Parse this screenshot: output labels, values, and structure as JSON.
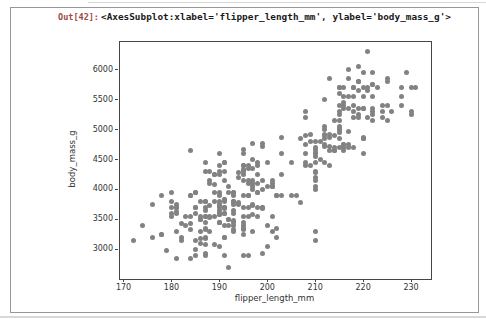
{
  "output_cell": {
    "prompt": "Out[42]:",
    "repr_text": "<AxesSubplot:xlabel='flipper_length_mm', ylabel='body_mass_g'>"
  },
  "colors": {
    "prompt": "#9e4b45",
    "point": "#828282",
    "spine": "#454545",
    "cell_border": "#979797",
    "tick_text": "#333333"
  },
  "chart_data": {
    "type": "scatter",
    "title": "",
    "xlabel": "flipper_length_mm",
    "ylabel": "body_mass_g",
    "xlim": [
      169.05,
      233.95
    ],
    "ylim": [
      2520,
      6480
    ],
    "xticks": [
      170,
      180,
      190,
      200,
      210,
      220,
      230
    ],
    "yticks": [
      3000,
      3500,
      4000,
      4500,
      5000,
      5500,
      6000
    ],
    "grid": false,
    "legend_position": "none",
    "points": [
      [
        181,
        3750
      ],
      [
        186,
        3800
      ],
      [
        195,
        3250
      ],
      [
        193,
        3450
      ],
      [
        190,
        3650
      ],
      [
        181,
        3625
      ],
      [
        195,
        4675
      ],
      [
        193,
        3475
      ],
      [
        190,
        4250
      ],
      [
        186,
        3300
      ],
      [
        180,
        3700
      ],
      [
        182,
        3200
      ],
      [
        191,
        3800
      ],
      [
        198,
        4400
      ],
      [
        185,
        3700
      ],
      [
        195,
        3450
      ],
      [
        197,
        4500
      ],
      [
        184,
        3325
      ],
      [
        194,
        4200
      ],
      [
        174,
        3400
      ],
      [
        180,
        3600
      ],
      [
        189,
        3800
      ],
      [
        185,
        3950
      ],
      [
        180,
        3800
      ],
      [
        187,
        3800
      ],
      [
        183,
        3550
      ],
      [
        187,
        3200
      ],
      [
        172,
        3150
      ],
      [
        180,
        3950
      ],
      [
        178,
        3250
      ],
      [
        178,
        3900
      ],
      [
        188,
        3300
      ],
      [
        184,
        3900
      ],
      [
        195,
        3325
      ],
      [
        196,
        4150
      ],
      [
        190,
        3950
      ],
      [
        180,
        3550
      ],
      [
        181,
        3300
      ],
      [
        184,
        4650
      ],
      [
        182,
        3150
      ],
      [
        195,
        3900
      ],
      [
        186,
        3100
      ],
      [
        196,
        4400
      ],
      [
        185,
        3000
      ],
      [
        190,
        4600
      ],
      [
        182,
        3425
      ],
      [
        179,
        2975
      ],
      [
        190,
        3450
      ],
      [
        191,
        4150
      ],
      [
        186,
        3500
      ],
      [
        188,
        4300
      ],
      [
        190,
        3450
      ],
      [
        200,
        4050
      ],
      [
        187,
        2900
      ],
      [
        191,
        3700
      ],
      [
        186,
        3550
      ],
      [
        193,
        3800
      ],
      [
        181,
        2850
      ],
      [
        194,
        3750
      ],
      [
        185,
        3150
      ],
      [
        195,
        4400
      ],
      [
        185,
        3600
      ],
      [
        192,
        4050
      ],
      [
        184,
        2850
      ],
      [
        192,
        3950
      ],
      [
        195,
        3350
      ],
      [
        188,
        4100
      ],
      [
        190,
        3050
      ],
      [
        198,
        4450
      ],
      [
        190,
        3600
      ],
      [
        190,
        3900
      ],
      [
        196,
        3550
      ],
      [
        197,
        4150
      ],
      [
        190,
        3700
      ],
      [
        195,
        4250
      ],
      [
        191,
        3700
      ],
      [
        184,
        3900
      ],
      [
        187,
        3550
      ],
      [
        195,
        4325
      ],
      [
        189,
        3950
      ],
      [
        187,
        3650
      ],
      [
        191,
        3675
      ],
      [
        183,
        3400
      ],
      [
        193,
        3600
      ],
      [
        184,
        3425
      ],
      [
        199,
        4150
      ],
      [
        190,
        3750
      ],
      [
        181,
        3700
      ],
      [
        197,
        4000
      ],
      [
        198,
        4100
      ],
      [
        191,
        3200
      ],
      [
        193,
        3900
      ],
      [
        197,
        3575
      ],
      [
        191,
        4450
      ],
      [
        196,
        3900
      ],
      [
        188,
        4150
      ],
      [
        199,
        3700
      ],
      [
        189,
        4250
      ],
      [
        189,
        3550
      ],
      [
        187,
        3325
      ],
      [
        198,
        3950
      ],
      [
        176,
        3200
      ],
      [
        202,
        3900
      ],
      [
        186,
        3500
      ],
      [
        199,
        3675
      ],
      [
        191,
        4450
      ],
      [
        195,
        3400
      ],
      [
        191,
        4300
      ],
      [
        210,
        4050
      ],
      [
        190,
        3575
      ],
      [
        197,
        4050
      ],
      [
        193,
        3300
      ],
      [
        199,
        3700
      ],
      [
        187,
        3450
      ],
      [
        190,
        4400
      ],
      [
        191,
        3600
      ],
      [
        200,
        3400
      ],
      [
        185,
        2900
      ],
      [
        193,
        3800
      ],
      [
        193,
        3950
      ],
      [
        187,
        3350
      ],
      [
        188,
        3550
      ],
      [
        190,
        3800
      ],
      [
        192,
        3500
      ],
      [
        185,
        3950
      ],
      [
        190,
        3600
      ],
      [
        184,
        3550
      ],
      [
        195,
        4300
      ],
      [
        193,
        3400
      ],
      [
        187,
        4450
      ],
      [
        201,
        3300
      ],
      [
        190,
        4300
      ],
      [
        191,
        3700
      ],
      [
        197,
        4350
      ],
      [
        191,
        2900
      ],
      [
        196,
        4100
      ],
      [
        188,
        3725
      ],
      [
        199,
        4725
      ],
      [
        189,
        3075
      ],
      [
        189,
        4250
      ],
      [
        187,
        2925
      ],
      [
        198,
        3550
      ],
      [
        176,
        3750
      ],
      [
        202,
        3900
      ],
      [
        186,
        3175
      ],
      [
        199,
        4775
      ],
      [
        191,
        3825
      ],
      [
        195,
        4600
      ],
      [
        191,
        3200
      ],
      [
        210,
        4275
      ],
      [
        192,
        3500
      ],
      [
        196,
        3900
      ],
      [
        193,
        3650
      ],
      [
        188,
        3525
      ],
      [
        197,
        3725
      ],
      [
        198,
        3950
      ],
      [
        178,
        3250
      ],
      [
        197,
        3750
      ],
      [
        195,
        4150
      ],
      [
        198,
        3700
      ],
      [
        193,
        3800
      ],
      [
        194,
        3775
      ],
      [
        185,
        3700
      ],
      [
        201,
        4050
      ],
      [
        190,
        3575
      ],
      [
        201,
        4050
      ],
      [
        197,
        3300
      ],
      [
        181,
        3700
      ],
      [
        190,
        3450
      ],
      [
        195,
        4400
      ],
      [
        181,
        3600
      ],
      [
        191,
        3400
      ],
      [
        187,
        3800
      ],
      [
        193,
        3950
      ],
      [
        195,
        3350
      ],
      [
        197,
        4100
      ],
      [
        200,
        3050
      ],
      [
        200,
        4450
      ],
      [
        191,
        3600
      ],
      [
        205,
        3900
      ],
      [
        187,
        3550
      ],
      [
        201,
        4150
      ],
      [
        187,
        3700
      ],
      [
        203,
        4250
      ],
      [
        195,
        3700
      ],
      [
        199,
        4000
      ],
      [
        195,
        3550
      ],
      [
        210,
        4300
      ],
      [
        192,
        3400
      ],
      [
        205,
        4450
      ],
      [
        210,
        3300
      ],
      [
        187,
        4300
      ],
      [
        196,
        3700
      ],
      [
        196,
        4350
      ],
      [
        196,
        2900
      ],
      [
        201,
        4100
      ],
      [
        190,
        3725
      ],
      [
        212,
        4725
      ],
      [
        187,
        3075
      ],
      [
        198,
        4250
      ],
      [
        199,
        2925
      ],
      [
        201,
        3550
      ],
      [
        193,
        3750
      ],
      [
        203,
        3900
      ],
      [
        187,
        3175
      ],
      [
        197,
        4775
      ],
      [
        191,
        3825
      ],
      [
        203,
        4600
      ],
      [
        202,
        3200
      ],
      [
        194,
        4275
      ],
      [
        206,
        3900
      ],
      [
        189,
        4075
      ],
      [
        195,
        2900
      ],
      [
        207,
        3775
      ],
      [
        202,
        3350
      ],
      [
        193,
        3325
      ],
      [
        210,
        3150
      ],
      [
        192,
        2700
      ],
      [
        211,
        4500
      ],
      [
        230,
        5700
      ],
      [
        210,
        4450
      ],
      [
        218,
        5700
      ],
      [
        215,
        5400
      ],
      [
        210,
        4550
      ],
      [
        211,
        4800
      ],
      [
        219,
        5200
      ],
      [
        209,
        4400
      ],
      [
        215,
        5150
      ],
      [
        214,
        4650
      ],
      [
        216,
        5550
      ],
      [
        214,
        4650
      ],
      [
        213,
        5850
      ],
      [
        210,
        4200
      ],
      [
        217,
        5850
      ],
      [
        210,
        4150
      ],
      [
        221,
        6300
      ],
      [
        209,
        4800
      ],
      [
        222,
        5350
      ],
      [
        218,
        5700
      ],
      [
        215,
        5000
      ],
      [
        213,
        4400
      ],
      [
        215,
        5050
      ],
      [
        215,
        5300
      ],
      [
        215,
        4950
      ],
      [
        216,
        5350
      ],
      [
        215,
        5700
      ],
      [
        210,
        4000
      ],
      [
        220,
        4600
      ],
      [
        222,
        5300
      ],
      [
        209,
        4925
      ],
      [
        207,
        4850
      ],
      [
        230,
        5300
      ],
      [
        220,
        4875
      ],
      [
        220,
        5350
      ],
      [
        213,
        4725
      ],
      [
        219,
        5350
      ],
      [
        208,
        4750
      ],
      [
        208,
        5200
      ],
      [
        208,
        4400
      ],
      [
        225,
        5150
      ],
      [
        210,
        4675
      ],
      [
        216,
        4650
      ],
      [
        222,
        5250
      ],
      [
        217,
        4750
      ],
      [
        210,
        4625
      ],
      [
        225,
        5850
      ],
      [
        213,
        4875
      ],
      [
        215,
        5000
      ],
      [
        210,
        4800
      ],
      [
        220,
        5700
      ],
      [
        210,
        4600
      ],
      [
        225,
        5800
      ],
      [
        217,
        4700
      ],
      [
        220,
        5550
      ],
      [
        208,
        4450
      ],
      [
        220,
        4850
      ],
      [
        208,
        5300
      ],
      [
        224,
        5400
      ],
      [
        208,
        4900
      ],
      [
        221,
        5700
      ],
      [
        214,
        4700
      ],
      [
        231,
        5700
      ],
      [
        219,
        5800
      ],
      [
        220,
        5950
      ],
      [
        216,
        5450
      ],
      [
        221,
        5200
      ],
      [
        212,
        4900
      ],
      [
        217,
        5350
      ],
      [
        215,
        5600
      ],
      [
        218,
        5300
      ],
      [
        217,
        5550
      ],
      [
        212,
        5050
      ],
      [
        222,
        5150
      ],
      [
        218,
        5400
      ],
      [
        215,
        5250
      ],
      [
        219,
        6050
      ],
      [
        214,
        5150
      ],
      [
        216,
        5400
      ],
      [
        219,
        5250
      ],
      [
        220,
        5350
      ],
      [
        223,
        5700
      ],
      [
        212,
        4750
      ],
      [
        221,
        5650
      ],
      [
        212,
        4850
      ],
      [
        224,
        5200
      ],
      [
        212,
        4925
      ],
      [
        220,
        4850
      ],
      [
        222,
        5750
      ],
      [
        218,
        5200
      ],
      [
        222,
        5950
      ],
      [
        213,
        4925
      ],
      [
        215,
        4850
      ],
      [
        222,
        5750
      ],
      [
        212,
        5000
      ],
      [
        216,
        5700
      ],
      [
        218,
        5550
      ],
      [
        217,
        4975
      ],
      [
        212,
        5500
      ],
      [
        218,
        4700
      ],
      [
        228,
        5550
      ],
      [
        212,
        4450
      ],
      [
        224,
        5300
      ],
      [
        214,
        4900
      ],
      [
        226,
        5300
      ],
      [
        216,
        4750
      ],
      [
        222,
        5550
      ],
      [
        203,
        4875
      ],
      [
        225,
        5400
      ],
      [
        219,
        5650
      ],
      [
        228,
        5700
      ],
      [
        215,
        4700
      ],
      [
        228,
        5400
      ],
      [
        216,
        4750
      ],
      [
        215,
        5700
      ],
      [
        210,
        4700
      ],
      [
        219,
        5800
      ],
      [
        208,
        4600
      ],
      [
        217,
        6000
      ],
      [
        216,
        4700
      ],
      [
        229,
        5950
      ],
      [
        213,
        4650
      ],
      [
        230,
        5250
      ]
    ]
  }
}
